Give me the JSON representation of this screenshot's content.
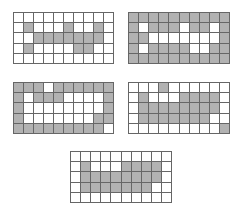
{
  "colors": {
    "filled": "#b2b2b2",
    "empty": "#ffffff",
    "line": "#666666"
  },
  "grids": [
    {
      "name": "grid-1",
      "rows": [
        [
          0,
          0,
          0,
          0,
          0,
          0,
          0,
          0,
          0,
          0
        ],
        [
          0,
          1,
          0,
          0,
          0,
          1,
          0,
          0,
          1,
          0
        ],
        [
          0,
          0,
          1,
          1,
          1,
          1,
          1,
          1,
          1,
          0
        ],
        [
          0,
          1,
          0,
          0,
          0,
          0,
          1,
          1,
          0,
          0
        ],
        [
          0,
          0,
          0,
          0,
          0,
          0,
          0,
          0,
          0,
          0
        ]
      ]
    },
    {
      "name": "grid-2",
      "rows": [
        [
          1,
          1,
          1,
          1,
          1,
          1,
          1,
          1,
          1,
          1
        ],
        [
          1,
          0,
          1,
          1,
          1,
          0,
          1,
          1,
          0,
          1
        ],
        [
          1,
          1,
          0,
          0,
          0,
          0,
          0,
          0,
          0,
          1
        ],
        [
          1,
          0,
          1,
          1,
          1,
          1,
          0,
          0,
          1,
          1
        ],
        [
          1,
          1,
          1,
          1,
          1,
          1,
          1,
          1,
          1,
          1
        ]
      ]
    },
    {
      "name": "grid-3",
      "rows": [
        [
          1,
          1,
          1,
          0,
          1,
          1,
          1,
          1,
          1,
          1
        ],
        [
          1,
          0,
          1,
          1,
          1,
          0,
          0,
          0,
          0,
          1
        ],
        [
          1,
          0,
          0,
          0,
          0,
          0,
          0,
          0,
          0,
          1
        ],
        [
          1,
          0,
          0,
          0,
          0,
          0,
          0,
          0,
          1,
          1
        ],
        [
          1,
          1,
          1,
          1,
          1,
          1,
          1,
          1,
          1,
          0
        ]
      ]
    },
    {
      "name": "grid-4",
      "rows": [
        [
          0,
          0,
          0,
          1,
          0,
          0,
          0,
          0,
          0,
          0
        ],
        [
          0,
          1,
          0,
          0,
          0,
          1,
          1,
          1,
          1,
          0
        ],
        [
          0,
          1,
          1,
          1,
          1,
          1,
          1,
          1,
          1,
          0
        ],
        [
          0,
          1,
          1,
          1,
          1,
          1,
          1,
          1,
          0,
          0
        ],
        [
          0,
          0,
          0,
          0,
          0,
          0,
          0,
          0,
          0,
          1
        ]
      ]
    },
    {
      "name": "grid-5",
      "rows": [
        [
          0,
          0,
          0,
          0,
          0,
          0,
          0,
          0,
          0,
          0
        ],
        [
          0,
          1,
          0,
          0,
          0,
          1,
          1,
          1,
          1,
          0
        ],
        [
          0,
          1,
          1,
          1,
          1,
          1,
          1,
          1,
          1,
          0
        ],
        [
          0,
          1,
          1,
          1,
          1,
          1,
          1,
          1,
          0,
          0
        ],
        [
          0,
          0,
          0,
          0,
          0,
          0,
          0,
          0,
          0,
          0
        ]
      ]
    }
  ]
}
